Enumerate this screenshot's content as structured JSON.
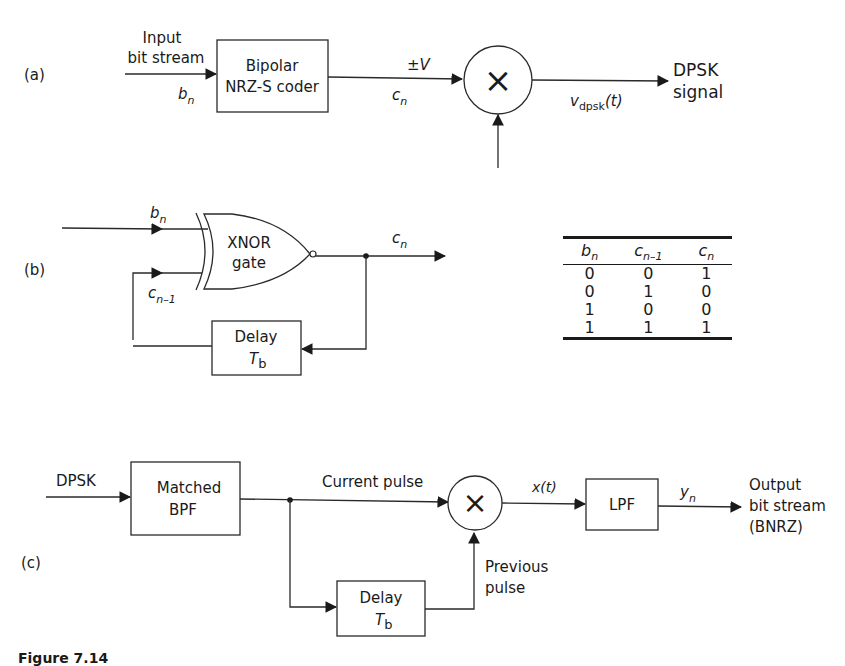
{
  "diagram_a": {
    "panel_label": "(a)",
    "input_label_line1": "Input",
    "input_label_line2": "bit stream",
    "input_symbol": "b",
    "input_symbol_sub": "n",
    "coder_line1": "Bipolar",
    "coder_line2": "NRZ-S coder",
    "coder_out_top": "±V",
    "coder_out_symbol": "c",
    "coder_out_sub": "n",
    "multiplier_symbol": "×",
    "output_symbol": "v",
    "output_sub": "dpsk",
    "output_arg": "(t)",
    "output_label_line1": "DPSK",
    "output_label_line2": "signal"
  },
  "diagram_b": {
    "panel_label": "(b)",
    "input_symbol": "b",
    "input_sub": "n",
    "feedback_symbol": "c",
    "feedback_sub": "n–1",
    "gate_line1": "XNOR",
    "gate_line2": "gate",
    "output_symbol": "c",
    "output_sub": "n",
    "delay_line1": "Delay",
    "delay_symbol": "T",
    "delay_sub": "b"
  },
  "truth_table": {
    "headers": [
      {
        "sym": "b",
        "sub": "n"
      },
      {
        "sym": "c",
        "sub": "n–1"
      },
      {
        "sym": "c",
        "sub": "n"
      }
    ],
    "rows": [
      [
        "0",
        "0",
        "1"
      ],
      [
        "0",
        "1",
        "0"
      ],
      [
        "1",
        "0",
        "0"
      ],
      [
        "1",
        "1",
        "1"
      ]
    ]
  },
  "diagram_c": {
    "panel_label": "(c)",
    "input_label": "DPSK",
    "filter_line1": "Matched",
    "filter_line2": "BPF",
    "current_pulse_label": "Current pulse",
    "multiplier_symbol": "×",
    "mult_out_symbol": "x(t)",
    "lpf_label": "LPF",
    "lpf_out_symbol": "y",
    "lpf_out_sub": "n",
    "output_line1": "Output",
    "output_line2": "bit stream",
    "output_line3": "(BNRZ)",
    "previous_pulse_line1": "Previous",
    "previous_pulse_line2": "pulse",
    "delay_line1": "Delay",
    "delay_symbol": "T",
    "delay_sub": "b"
  },
  "caption": "Figure 7.14"
}
